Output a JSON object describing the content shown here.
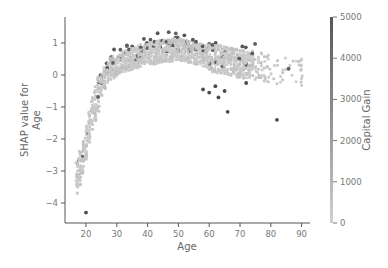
{
  "chart_data": {
    "type": "scatter",
    "title": "",
    "xlabel": "Age",
    "ylabel": "SHAP value for\nAge",
    "xlim": [
      14,
      93
    ],
    "ylim": [
      -4.6,
      1.8
    ],
    "x_ticks": [
      20,
      30,
      40,
      50,
      60,
      70,
      80,
      90
    ],
    "y_ticks": [
      -4,
      -3,
      -2,
      -1,
      0,
      1
    ],
    "grid": false,
    "colorbar": {
      "label": "Capital Gain",
      "min": 0,
      "max": 5000,
      "ticks": [
        0,
        1000,
        2000,
        3000,
        4000,
        5000
      ],
      "color_low": "#d0d0d0",
      "color_high": "#555555"
    },
    "trend": {
      "description": "SHAP value rises steeply from about -3.2 at age 17 to about 0 at age 30, peaks near 0.8 around age 45-55, then declines slightly to ~0.3 by age 75; sparse points beyond 80",
      "x": [
        17,
        18,
        19,
        20,
        21,
        22,
        23,
        24,
        25,
        26,
        27,
        28,
        30,
        32,
        35,
        38,
        40,
        45,
        50,
        55,
        60,
        65,
        70,
        75,
        80,
        85,
        90
      ],
      "y_median": [
        -3.2,
        -2.9,
        -2.6,
        -2.1,
        -1.6,
        -1.2,
        -0.9,
        -0.6,
        -0.3,
        -0.1,
        0.1,
        0.2,
        0.3,
        0.4,
        0.5,
        0.6,
        0.65,
        0.75,
        0.8,
        0.7,
        0.55,
        0.45,
        0.35,
        0.3,
        0.2,
        0.1,
        0.1
      ]
    },
    "highlighted_high_capital_gain_points": [
      {
        "x": 20,
        "y": -4.3
      },
      {
        "x": 58,
        "y": -0.45
      },
      {
        "x": 60,
        "y": -0.55
      },
      {
        "x": 62,
        "y": -0.35
      },
      {
        "x": 63,
        "y": -0.7
      },
      {
        "x": 65,
        "y": -0.5
      },
      {
        "x": 66,
        "y": -1.15
      },
      {
        "x": 72,
        "y": -0.25
      },
      {
        "x": 82,
        "y": -1.4
      }
    ]
  }
}
